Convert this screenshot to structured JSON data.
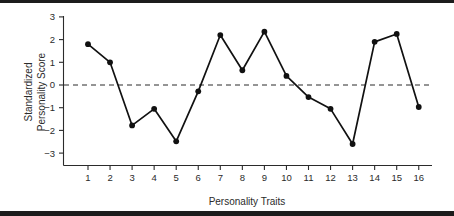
{
  "chart_data": {
    "type": "line",
    "title": "",
    "subtitle": "",
    "xlabel": "Personality Traits",
    "ylabel_line1": "Standardized",
    "ylabel_line2": "Personality Score",
    "ylabel": "Standardized Personality Score",
    "categories": [
      "1",
      "2",
      "3",
      "4",
      "5",
      "6",
      "7",
      "8",
      "9",
      "10",
      "11",
      "12",
      "13",
      "14",
      "15",
      "16"
    ],
    "x": [
      1,
      2,
      3,
      4,
      5,
      6,
      7,
      8,
      9,
      10,
      11,
      12,
      13,
      14,
      15,
      16
    ],
    "values": [
      1.8,
      1.0,
      -1.78,
      -1.05,
      -2.48,
      -0.28,
      2.2,
      0.65,
      2.35,
      0.4,
      -0.53,
      -1.05,
      -2.6,
      1.9,
      2.25,
      -0.97
    ],
    "series": [
      {
        "name": "Standardized Personality Score",
        "values": [
          1.8,
          1.0,
          -1.78,
          -1.05,
          -2.48,
          -0.28,
          2.2,
          0.65,
          2.35,
          0.4,
          -0.53,
          -1.05,
          -2.6,
          1.9,
          2.25,
          -0.97
        ]
      }
    ],
    "xlim": [
      0.3,
      16.7
    ],
    "ylim": [
      -3.5,
      3.5
    ],
    "yticks": [
      3,
      2,
      1,
      0,
      -1,
      -2,
      -3
    ],
    "ytick_labels": [
      "3",
      "2",
      "1",
      "0",
      "−1",
      "−2",
      "−3"
    ],
    "xticks": [
      1,
      2,
      3,
      4,
      5,
      6,
      7,
      8,
      9,
      10,
      11,
      12,
      13,
      14,
      15,
      16
    ],
    "xtick_labels": [
      "1",
      "2",
      "3",
      "4",
      "5",
      "6",
      "7",
      "8",
      "9",
      "10",
      "11",
      "12",
      "13",
      "14",
      "15",
      "16"
    ],
    "grid": false,
    "legend": false,
    "legend_position": "none",
    "reference_lines": [
      {
        "axis": "y",
        "value": 0,
        "style": "dashed",
        "color": "#2b2b2b"
      }
    ],
    "marker": "circle",
    "line_color": "#111111",
    "marker_color": "#111111"
  },
  "figure": {
    "background_color": "#ffffff",
    "border_color": "#1c1c1c"
  }
}
